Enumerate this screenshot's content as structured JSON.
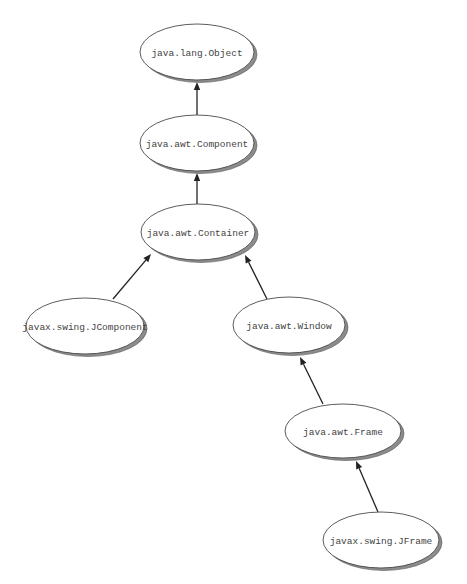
{
  "diagram": {
    "type": "class-inheritance-hierarchy",
    "colors": {
      "node_fill": "#ffffff",
      "node_stroke": "#4a4a4a",
      "shadow": "#8c8c8c",
      "edge": "#222222",
      "text": "#444444"
    },
    "nodes": [
      {
        "id": "object",
        "label": "java.lang.Object",
        "cx": 197,
        "cy": 52,
        "rx": 57,
        "ry": 28
      },
      {
        "id": "component",
        "label": "java.awt.Component",
        "cx": 197,
        "cy": 143,
        "rx": 57,
        "ry": 28
      },
      {
        "id": "container",
        "label": "java.awt.Container",
        "cx": 198,
        "cy": 232,
        "rx": 57,
        "ry": 28
      },
      {
        "id": "jcomponent",
        "label": "javax.swing.JComponent",
        "cx": 85,
        "cy": 326,
        "rx": 59,
        "ry": 28
      },
      {
        "id": "window",
        "label": "java.awt.Window",
        "cx": 289,
        "cy": 325,
        "rx": 56,
        "ry": 28
      },
      {
        "id": "frame",
        "label": "java.awt.Frame",
        "cx": 343,
        "cy": 431,
        "rx": 58,
        "ry": 27
      },
      {
        "id": "jframe",
        "label": "javax.swing.JFrame",
        "cx": 381,
        "cy": 540,
        "rx": 58,
        "ry": 28
      }
    ],
    "edges": [
      {
        "from": "component",
        "to": "object",
        "x1": 197,
        "y1": 115,
        "x2": 197,
        "y2": 82
      },
      {
        "from": "container",
        "to": "component",
        "x1": 197,
        "y1": 204,
        "x2": 197,
        "y2": 173
      },
      {
        "from": "jcomponent",
        "to": "container",
        "x1": 113,
        "y1": 299,
        "x2": 151,
        "y2": 254
      },
      {
        "from": "window",
        "to": "container",
        "x1": 267,
        "y1": 299,
        "x2": 245,
        "y2": 255
      },
      {
        "from": "frame",
        "to": "window",
        "x1": 323,
        "y1": 404,
        "x2": 300,
        "y2": 357
      },
      {
        "from": "jframe",
        "to": "frame",
        "x1": 378,
        "y1": 512,
        "x2": 356,
        "y2": 461
      }
    ]
  }
}
